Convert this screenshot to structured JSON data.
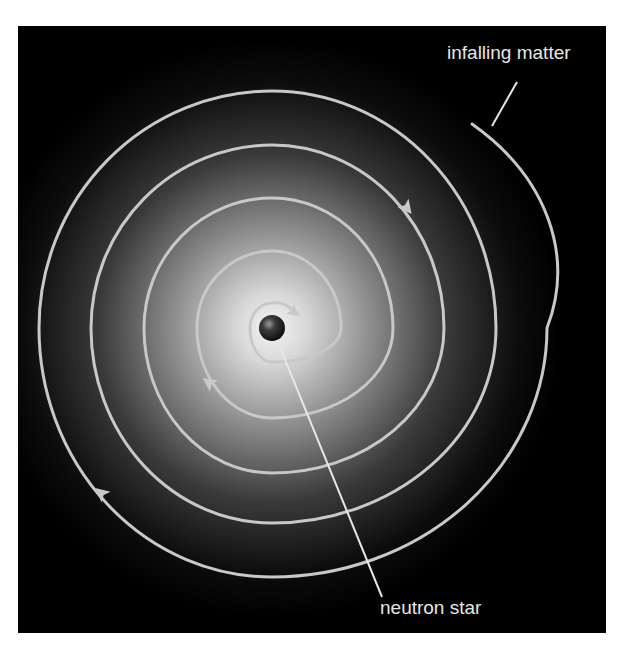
{
  "diagram": {
    "labels": {
      "infalling_matter": "infalling matter",
      "neutron_star": "neutron star"
    },
    "colors": {
      "background": "#000000",
      "glow_center": "#f2f2f2",
      "spiral": "#c8c8c8",
      "text": "#e6e6e6",
      "star": "#2a2a2a"
    },
    "spiral_direction": "clockwise-inward"
  }
}
